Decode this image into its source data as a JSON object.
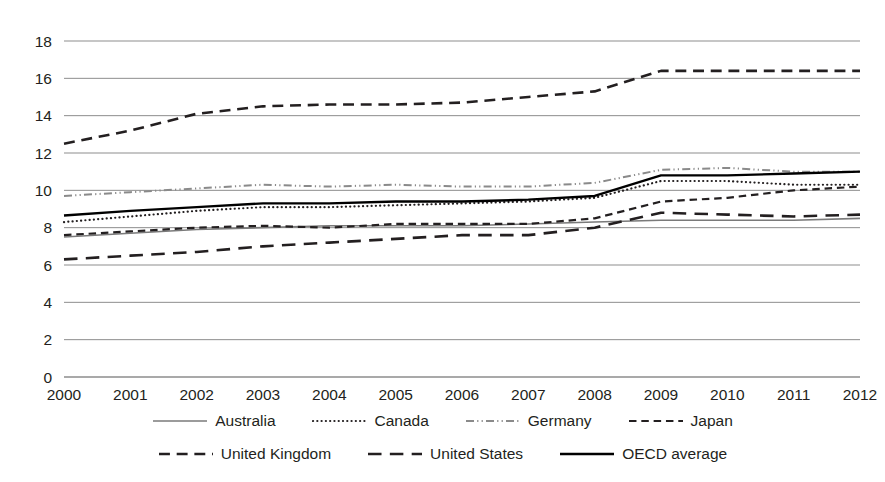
{
  "chart_data": {
    "type": "line",
    "title": "",
    "subtitle": "",
    "xlabel": "",
    "ylabel": "",
    "x": [
      2000,
      2001,
      2002,
      2003,
      2004,
      2005,
      2006,
      2007,
      2008,
      2009,
      2010,
      2011,
      2012
    ],
    "categories": [
      "2000",
      "2001",
      "2002",
      "2003",
      "2004",
      "2005",
      "2006",
      "2007",
      "2008",
      "2009",
      "2010",
      "2011",
      "2012"
    ],
    "xlim": [
      2000,
      2012
    ],
    "ylim": [
      0,
      18
    ],
    "yticks": [
      0,
      2,
      4,
      6,
      8,
      10,
      12,
      14,
      16,
      18
    ],
    "ytick_labels": [
      "0",
      "2",
      "4",
      "6",
      "8",
      "10",
      "12",
      "14",
      "16",
      "18"
    ],
    "grid": "horizontal",
    "legend_position": "bottom",
    "series": [
      {
        "name": "Australia",
        "style": "solid",
        "color": "#7a7a7a",
        "width": 1.6,
        "values": [
          7.5,
          7.7,
          7.9,
          8.0,
          8.1,
          8.1,
          8.1,
          8.2,
          8.3,
          8.4,
          8.4,
          8.4,
          8.5
        ]
      },
      {
        "name": "Canada",
        "style": "dotted",
        "color": "#231f20",
        "width": 2.2,
        "values": [
          8.3,
          8.6,
          8.9,
          9.1,
          9.1,
          9.2,
          9.3,
          9.4,
          9.6,
          10.5,
          10.5,
          10.3,
          10.3
        ]
      },
      {
        "name": "Germany",
        "style": "dashdot",
        "color": "#8a8a8a",
        "width": 2.0,
        "values": [
          9.7,
          9.9,
          10.1,
          10.3,
          10.2,
          10.3,
          10.2,
          10.2,
          10.4,
          11.1,
          11.2,
          11.0,
          11.0
        ]
      },
      {
        "name": "Japan",
        "style": "dashed-short",
        "color": "#231f20",
        "width": 2.2,
        "values": [
          7.6,
          7.8,
          8.0,
          8.1,
          8.0,
          8.2,
          8.2,
          8.2,
          8.5,
          9.4,
          9.6,
          10.0,
          10.2
        ]
      },
      {
        "name": "United Kingdom",
        "style": "dashed",
        "color": "#231f20",
        "width": 2.6,
        "values": [
          12.5,
          13.2,
          14.1,
          14.5,
          14.6,
          14.6,
          14.7,
          15.0,
          15.3,
          16.4,
          16.4,
          16.4,
          16.4
        ]
      },
      {
        "name": "United States",
        "style": "dashed-long",
        "color": "#231f20",
        "width": 2.6,
        "values": [
          6.3,
          6.5,
          6.7,
          7.0,
          7.2,
          7.4,
          7.6,
          7.6,
          8.0,
          8.8,
          8.7,
          8.6,
          8.7
        ]
      },
      {
        "name": "OECD average",
        "style": "solid",
        "color": "#000000",
        "width": 2.4,
        "values": [
          8.65,
          8.9,
          9.1,
          9.3,
          9.3,
          9.4,
          9.4,
          9.5,
          9.7,
          10.8,
          10.8,
          10.9,
          11.0
        ]
      }
    ]
  },
  "legend": {
    "rows": [
      [
        {
          "name": "Australia",
          "sample": "solid-gray"
        },
        {
          "name": "Canada",
          "sample": "dotted"
        },
        {
          "name": "Germany",
          "sample": "dashdot-gray"
        },
        {
          "name": "Japan",
          "sample": "dashed-short"
        }
      ],
      [
        {
          "name": "United Kingdom",
          "sample": "dashed"
        },
        {
          "name": "United States",
          "sample": "dashed-long"
        },
        {
          "name": "OECD average",
          "sample": "solid-black"
        }
      ]
    ]
  },
  "colors": {
    "grid": "#8d8d8d",
    "text": "#231f20",
    "background": "#ffffff",
    "gray_series": "#7a7a7a",
    "black_series": "#000000"
  }
}
